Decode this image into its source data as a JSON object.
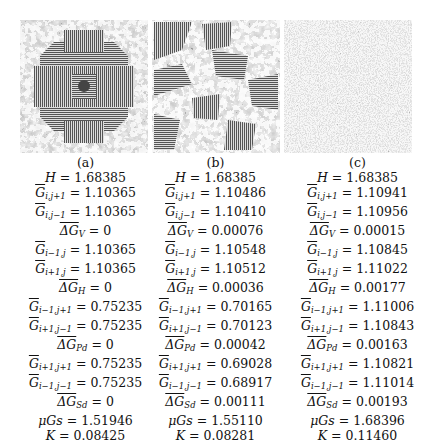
{
  "figure": {
    "panels": [
      {
        "caption": "(a)",
        "image_description": "symmetric texture with striped cross pattern",
        "metrics": {
          "H": "1.68385",
          "G_i_j+1": "1.10365",
          "G_i_j-1": "1.10365",
          "dG_V": "0",
          "G_i-1_j": "1.10365",
          "G_i+1_j": "1.10365",
          "dG_H": "0",
          "G_i-1_j+1": "0.75235",
          "G_i+1_j-1": "0.75235",
          "dG_Pd": "0",
          "G_i+1_j+1": "0.75235",
          "G_i-1_j-1": "0.75235",
          "dG_Sd": "0",
          "muGs": "1.51946",
          "K": "0.08425"
        }
      },
      {
        "caption": "(b)",
        "image_description": "mixed striped patches and noisy regions",
        "metrics": {
          "H": "1.68385",
          "G_i_j+1": "1.10486",
          "G_i_j-1": "1.10410",
          "dG_V": "0.00076",
          "G_i-1_j": "1.10548",
          "G_i+1_j": "1.10512",
          "dG_H": "0.00036",
          "G_i-1_j+1": "0.70165",
          "G_i+1_j-1": "0.70123",
          "dG_Pd": "0.00042",
          "G_i+1_j+1": "0.69028",
          "G_i-1_j-1": "0.68917",
          "dG_Sd": "0.00111",
          "muGs": "1.55110",
          "K": "0.08281"
        }
      },
      {
        "caption": "(c)",
        "image_description": "random noise texture",
        "metrics": {
          "H": "1.68385",
          "G_i_j+1": "1.10941",
          "G_i_j-1": "1.10956",
          "dG_V": "0.00015",
          "G_i-1_j": "1.10845",
          "G_i+1_j": "1.11022",
          "dG_H": "0.00177",
          "G_i-1_j+1": "1.11006",
          "G_i+1_j-1": "1.10843",
          "dG_Pd": "0.00163",
          "G_i+1_j+1": "1.10821",
          "G_i-1_j-1": "1.11014",
          "dG_Sd": "0.00193",
          "muGs": "1.68396",
          "K": "0.11460"
        }
      }
    ],
    "labels": {
      "H": "H",
      "G": "G",
      "dG": "ΔG",
      "mu": "μGs",
      "K": "K",
      "eq": " = ",
      "sub_i_jp1": "i,j+1",
      "sub_i_jm1": "i,j−1",
      "sub_V": "V",
      "sub_im1_j": "i−1,j",
      "sub_ip1_j": "i+1,j",
      "sub_H": "H",
      "sub_im1_jp1": "i−1,j+1",
      "sub_ip1_jm1": "i+1,j−1",
      "sub_Pd": "Pd",
      "sub_ip1_jp1": "i+1,j+1",
      "sub_im1_jm1": "i−1,j−1",
      "sub_Sd": "Sd"
    }
  }
}
